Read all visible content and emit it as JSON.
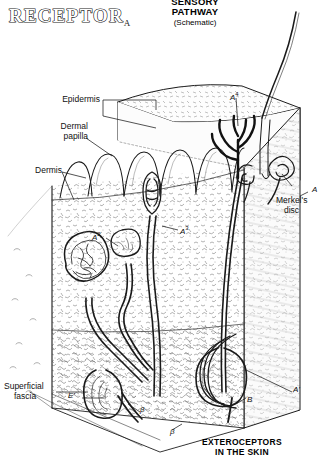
{
  "figure": {
    "title_main": "RECEPTOR",
    "title_subscript": "A",
    "header_line1": "SENSORY",
    "header_line2": "PATHWAY",
    "header_line3": "(Schematic)",
    "caption_line1": "EXTEROCEPTORS",
    "caption_line2": "IN THE SKIN",
    "ink_color": "#1a1a1a",
    "background_color": "#ffffff"
  },
  "labels": {
    "epidermis": "Epidermis",
    "dermal_papilla_l1": "Dermal",
    "dermal_papilla_l2": "papilla",
    "dermis": "Dermis",
    "superficial_fascia_l1": "Superficial",
    "superficial_fascia_l2": "fascia",
    "merkels_disc_l1": "Merkel's",
    "merkels_disc_l2": "disc"
  },
  "annotations": {
    "a_right": "A",
    "a_prime": "A'",
    "a2": "A",
    "a2_sup": "2",
    "a3": "A",
    "a3_sup": "3",
    "a4": "A",
    "a4_sup": "4",
    "b": "B",
    "e_prime": "E'",
    "beta_left": "β",
    "beta_bottom": "β"
  }
}
